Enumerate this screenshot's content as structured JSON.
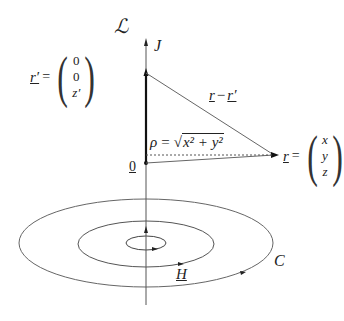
{
  "diagram": {
    "line_label": "ℒ",
    "current_label": "J",
    "source_point": {
      "symbol": "r′",
      "components": [
        "0",
        "0",
        "z′"
      ]
    },
    "field_point": {
      "symbol": "r",
      "components": [
        "x",
        "y",
        "z"
      ]
    },
    "difference_label_a": "r",
    "difference_label_minus": "−",
    "difference_label_b": "r′",
    "rho_label": "ρ = √(x² + y²)",
    "rho_symbol": "ρ",
    "rho_eq": "=",
    "rho_radicand": "x² + y²",
    "origin_label": "0",
    "field_label": "H",
    "curve_label": "C",
    "equals": "="
  },
  "colors": {
    "stroke": "#555555",
    "thick_stroke": "#111111",
    "text": "#222222",
    "background": "#ffffff"
  }
}
